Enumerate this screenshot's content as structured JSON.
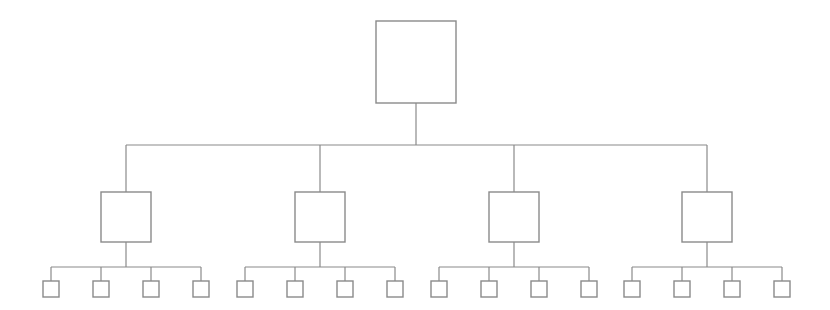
{
  "diagram": {
    "type": "hierarchy-tree",
    "orientation": "top-down",
    "levels": 3,
    "canvas": {
      "width": 830,
      "height": 310,
      "background": "#ffffff"
    },
    "style": {
      "line_color": "#8a8a8a",
      "line_width": 1.2,
      "node_fill": "#ffffff",
      "node_stroke": "#8a8a8a",
      "node_stroke_width": 1.4
    },
    "node_counts": {
      "root": 1,
      "level2": 4,
      "level3": 16,
      "total": 21
    },
    "root": {
      "id": "root",
      "label": "",
      "x": 376,
      "y": 21,
      "width": 80,
      "height": 82,
      "center_x": 416,
      "center_y": 62
    },
    "level2_nodes": [
      {
        "id": "l2-1",
        "label": "",
        "x": 101,
        "y": 192,
        "width": 50,
        "height": 50,
        "center_x": 126
      },
      {
        "id": "l2-2",
        "label": "",
        "x": 295,
        "y": 192,
        "width": 50,
        "height": 50,
        "center_x": 320
      },
      {
        "id": "l2-3",
        "label": "",
        "x": 489,
        "y": 192,
        "width": 50,
        "height": 50,
        "center_x": 514
      },
      {
        "id": "l2-4",
        "label": "",
        "x": 682,
        "y": 192,
        "width": 50,
        "height": 50,
        "center_x": 707
      }
    ],
    "level3_groups": [
      {
        "id": "group-1",
        "parent": "l2-1",
        "bar_y": 267,
        "leaves": [
          {
            "id": "l3-1-1",
            "label": "",
            "center_x": 51,
            "y": 281,
            "size": 16
          },
          {
            "id": "l3-1-2",
            "label": "",
            "center_x": 101,
            "y": 281,
            "size": 16
          },
          {
            "id": "l3-1-3",
            "label": "",
            "center_x": 151,
            "y": 281,
            "size": 16
          },
          {
            "id": "l3-1-4",
            "label": "",
            "center_x": 201,
            "y": 281,
            "size": 16
          }
        ]
      },
      {
        "id": "group-2",
        "parent": "l2-2",
        "bar_y": 267,
        "leaves": [
          {
            "id": "l3-2-1",
            "label": "",
            "center_x": 245,
            "y": 281,
            "size": 16
          },
          {
            "id": "l3-2-2",
            "label": "",
            "center_x": 295,
            "y": 281,
            "size": 16
          },
          {
            "id": "l3-2-3",
            "label": "",
            "center_x": 345,
            "y": 281,
            "size": 16
          },
          {
            "id": "l3-2-4",
            "label": "",
            "center_x": 395,
            "y": 281,
            "size": 16
          }
        ]
      },
      {
        "id": "group-3",
        "parent": "l2-3",
        "bar_y": 267,
        "leaves": [
          {
            "id": "l3-3-1",
            "label": "",
            "center_x": 439,
            "y": 281,
            "size": 16
          },
          {
            "id": "l3-3-2",
            "label": "",
            "center_x": 489,
            "y": 281,
            "size": 16
          },
          {
            "id": "l3-3-3",
            "label": "",
            "center_x": 539,
            "y": 281,
            "size": 16
          },
          {
            "id": "l3-3-4",
            "label": "",
            "center_x": 589,
            "y": 281,
            "size": 16
          }
        ]
      },
      {
        "id": "group-4",
        "parent": "l2-4",
        "bar_y": 267,
        "leaves": [
          {
            "id": "l3-4-1",
            "label": "",
            "center_x": 632,
            "y": 281,
            "size": 16
          },
          {
            "id": "l3-4-2",
            "label": "",
            "center_x": 682,
            "y": 281,
            "size": 16
          },
          {
            "id": "l3-4-3",
            "label": "",
            "center_x": 732,
            "y": 281,
            "size": 16
          },
          {
            "id": "l3-4-4",
            "label": "",
            "center_x": 782,
            "y": 281,
            "size": 16
          }
        ]
      }
    ],
    "connectors": {
      "root_stem": {
        "x": 416,
        "y_start": 103,
        "y_end": 145
      },
      "level2_bar": {
        "y": 145,
        "x_start": 126,
        "x_end": 707
      },
      "level2_drops_y_end": 192,
      "level2_to_bar_stem_y_start": 242,
      "level3_bar_y": 267,
      "level3_drops_y_end": 281
    }
  }
}
